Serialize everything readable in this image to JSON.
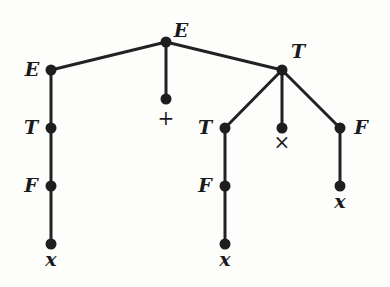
{
  "diagram": {
    "type": "parse-tree",
    "colors": {
      "edge": "#222222",
      "node": "#1e1e1e",
      "label": "#1a1a1a",
      "background": "#fdfdfc"
    },
    "nodes": [
      {
        "id": "n0",
        "label": "E",
        "x": 166,
        "y": 42,
        "lx": 181,
        "ly": 37,
        "anchor": "middle",
        "sym": false
      },
      {
        "id": "n1",
        "label": "E",
        "x": 51,
        "y": 70,
        "lx": 32,
        "ly": 76,
        "anchor": "middle",
        "sym": false
      },
      {
        "id": "n2",
        "label": "+",
        "x": 166,
        "y": 99,
        "lx": 166,
        "ly": 125,
        "anchor": "middle",
        "sym": true
      },
      {
        "id": "n3",
        "label": "T",
        "x": 282,
        "y": 70,
        "lx": 298,
        "ly": 58,
        "anchor": "middle",
        "sym": false
      },
      {
        "id": "n4",
        "label": "T",
        "x": 51,
        "y": 128,
        "lx": 31,
        "ly": 134,
        "anchor": "middle",
        "sym": false
      },
      {
        "id": "n5",
        "label": "F",
        "x": 51,
        "y": 186,
        "lx": 31,
        "ly": 192,
        "anchor": "middle",
        "sym": false
      },
      {
        "id": "n6",
        "label": "x",
        "x": 51,
        "y": 244,
        "lx": 51,
        "ly": 266,
        "anchor": "middle",
        "sym": false
      },
      {
        "id": "n7",
        "label": "T",
        "x": 225,
        "y": 128,
        "lx": 205,
        "ly": 134,
        "anchor": "middle",
        "sym": false
      },
      {
        "id": "n8",
        "label": "×",
        "x": 282,
        "y": 128,
        "lx": 282,
        "ly": 149,
        "anchor": "middle",
        "sym": true
      },
      {
        "id": "n9",
        "label": "F",
        "x": 340,
        "y": 128,
        "lx": 361,
        "ly": 134,
        "anchor": "middle",
        "sym": false
      },
      {
        "id": "n10",
        "label": "F",
        "x": 225,
        "y": 186,
        "lx": 205,
        "ly": 192,
        "anchor": "middle",
        "sym": false
      },
      {
        "id": "n11",
        "label": "x",
        "x": 225,
        "y": 244,
        "lx": 225,
        "ly": 266,
        "anchor": "middle",
        "sym": false
      },
      {
        "id": "n12",
        "label": "x",
        "x": 340,
        "y": 186,
        "lx": 340,
        "ly": 208,
        "anchor": "middle",
        "sym": false
      }
    ],
    "edges": [
      [
        "n0",
        "n1"
      ],
      [
        "n0",
        "n2"
      ],
      [
        "n0",
        "n3"
      ],
      [
        "n1",
        "n4"
      ],
      [
        "n4",
        "n5"
      ],
      [
        "n5",
        "n6"
      ],
      [
        "n3",
        "n7"
      ],
      [
        "n3",
        "n8"
      ],
      [
        "n3",
        "n9"
      ],
      [
        "n7",
        "n10"
      ],
      [
        "n10",
        "n11"
      ],
      [
        "n9",
        "n12"
      ]
    ]
  }
}
